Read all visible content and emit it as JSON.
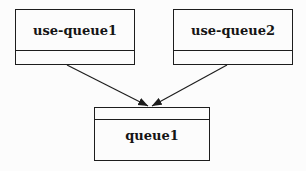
{
  "diagram": {
    "type": "uml-object-diagram",
    "background_color": "#fcfcfc",
    "line_color": "#1d1d1d",
    "text_color": "#151515",
    "nodes": [
      {
        "id": "use-queue1",
        "label": "use-queue1",
        "shape": "rectangle-with-empty-bottom-compartment"
      },
      {
        "id": "use-queue2",
        "label": "use-queue2",
        "shape": "rectangle-with-empty-bottom-compartment"
      },
      {
        "id": "queue1",
        "label": "queue1",
        "shape": "rectangle-with-empty-top-compartment"
      }
    ],
    "edges": [
      {
        "from": "use-queue1",
        "to": "queue1",
        "style": "solid-line-arrowhead"
      },
      {
        "from": "use-queue2",
        "to": "queue1",
        "style": "solid-line-arrowhead"
      }
    ]
  }
}
